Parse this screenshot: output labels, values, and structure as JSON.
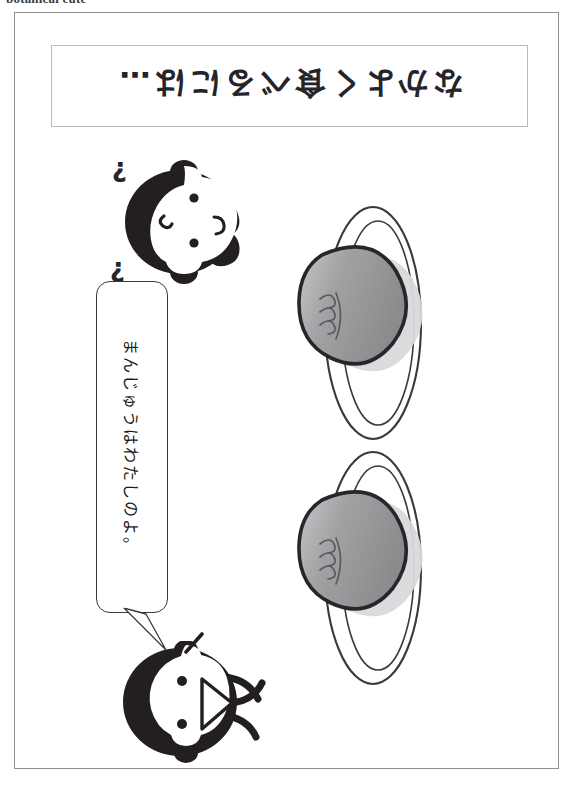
{
  "page": {
    "header_caption": "botanical cute",
    "width": 573,
    "height": 796,
    "background_color": "#ffffff",
    "frame_color": "#8f9094"
  },
  "title_panel": {
    "name": "title-panel",
    "text": "なかよく食べるには…",
    "romanized": "nakayoku taberu niwa...",
    "translation": "How to eat together nicely...",
    "orientation": "rotated-180",
    "border_color": "#b9bbbe",
    "text_color": "#24242a"
  },
  "speech_balloon": {
    "name": "speech-balloon",
    "text": "まんじゅうはわたしのよ。",
    "romanized": "manjuu wa watashi no yo.",
    "translation": "The manju is mine.",
    "orientation": "rotated-90",
    "border_color": "#3a3a3e",
    "tail_direction": "down-right"
  },
  "characters": [
    {
      "name": "character-top-confused",
      "description": "round animal face with ears, confused expression",
      "emotes": [
        "?",
        "?"
      ],
      "fill_color": "#231f20"
    },
    {
      "name": "character-bottom-speaking",
      "description": "round animal face with whiskers, open triangular mouth",
      "emotes": [],
      "fill_color": "#231f20"
    }
  ],
  "plates": [
    {
      "name": "plate-top",
      "label": "manju on plate",
      "food": "manju",
      "food_fill_start": "#8e8e90",
      "food_fill_end": "#c9c9cb",
      "outline_color": "#26262b",
      "plate_outline_color": "#3a3a3e",
      "steam_marks": 3
    },
    {
      "name": "plate-bottom",
      "label": "manju on plate",
      "food": "manju",
      "food_fill_start": "#8e8e90",
      "food_fill_end": "#c9c9cb",
      "outline_color": "#26262b",
      "plate_outline_color": "#3a3a3e",
      "steam_marks": 3
    }
  ]
}
